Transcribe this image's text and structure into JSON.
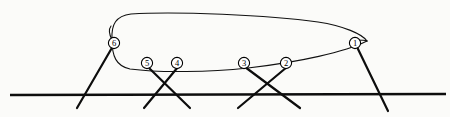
{
  "figure": {
    "background_color": "#fbfbf9",
    "ink_color": "#0d0d0d",
    "node_fill_color": "#ffffff"
  },
  "ground": {
    "label": "ground-line",
    "x1": 10,
    "y1": 95,
    "x2": 446,
    "y2": 94
  },
  "body": {
    "label": "body-outline",
    "top_path": "M 112,40 C 111,24 116,16 131,14 C 175,11 268,15 318,22 C 344,26 362,34 367,41",
    "bottom_path": "M 112,40 C 112,56 116,66 130,69 C 160,73 210,72 248,68 C 300,62 345,52 367,41",
    "left_cap_path": "M 112,40 C 109,34 108,30 111,26",
    "apex_path": "M 355,40 C 361,40 365,40 367,41"
  },
  "nodes": [
    {
      "id": "1",
      "label": "1",
      "cx": 355,
      "cy": 43,
      "r": 5.6
    },
    {
      "id": "2",
      "label": "2",
      "cx": 286,
      "cy": 63,
      "r": 5.6
    },
    {
      "id": "3",
      "label": "3",
      "cx": 244,
      "cy": 63,
      "r": 5.6
    },
    {
      "id": "4",
      "label": "4",
      "cx": 177,
      "cy": 63,
      "r": 5.6
    },
    {
      "id": "5",
      "label": "5",
      "cx": 147,
      "cy": 63,
      "r": 5.6
    },
    {
      "id": "6",
      "label": "6",
      "cx": 114,
      "cy": 43,
      "r": 5.6
    }
  ],
  "legs": [
    {
      "name": "leg-6",
      "from_node": "6",
      "x1": 113,
      "y1": 46,
      "x2": 77,
      "y2": 108
    },
    {
      "name": "leg-5",
      "from_node": "5",
      "x1": 148,
      "y1": 67,
      "x2": 190,
      "y2": 108
    },
    {
      "name": "leg-4",
      "from_node": "4",
      "x1": 178,
      "y1": 67,
      "x2": 144,
      "y2": 108
    },
    {
      "name": "leg-3",
      "from_node": "3",
      "x1": 245,
      "y1": 67,
      "x2": 300,
      "y2": 108
    },
    {
      "name": "leg-2",
      "from_node": "2",
      "x1": 287,
      "y1": 67,
      "x2": 238,
      "y2": 108
    },
    {
      "name": "leg-1",
      "from_node": "1",
      "x1": 357,
      "y1": 47,
      "x2": 388,
      "y2": 111
    }
  ]
}
